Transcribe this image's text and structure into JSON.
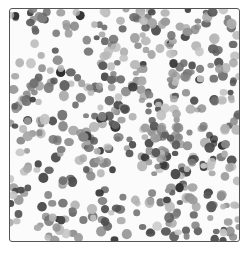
{
  "image": {
    "subject": "Histology micrograph: densely packed round cell nuclei stained dark grey on a pale background",
    "alt": "Grayscale microscopy image of densely packed cell nuclei",
    "frame": {
      "x": 9,
      "y": 8,
      "width": 229,
      "height": 232,
      "border_color": "#555555"
    },
    "background_color": "#fbfbfb",
    "cells": {
      "count": 520,
      "seed": 7,
      "radius_min": 3.0,
      "radius_max": 5.2,
      "tone_dark": 40,
      "tone_light": 200,
      "clear_regions": [
        {
          "cx": 115,
          "cy": 172,
          "r": 22
        },
        {
          "cx": 150,
          "cy": 55,
          "r": 14
        },
        {
          "cx": 28,
          "cy": 140,
          "r": 12
        },
        {
          "cx": 60,
          "cy": 110,
          "r": 10
        }
      ]
    }
  }
}
